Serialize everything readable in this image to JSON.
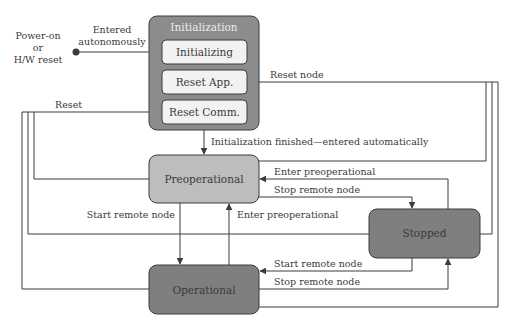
{
  "diagram": {
    "type": "state-machine",
    "colors": {
      "background": "#ffffff",
      "line": "#3c3c3c",
      "text": "#3a3a3a",
      "initialization_fill": "#8c8c8c",
      "substate_fill": "#f2f2f2",
      "preoperational_fill": "#bdbdbd",
      "stopped_fill": "#7f7f7f",
      "operational_fill": "#7f7f7f"
    },
    "start": {
      "label_lines": [
        "Power-on",
        "or",
        "H/W reset"
      ],
      "transition_label_lines": [
        "Entered",
        "autonomously"
      ]
    },
    "initialization": {
      "title": "Initialization",
      "substates": [
        {
          "id": "initializing",
          "label": "Initializing"
        },
        {
          "id": "reset-app",
          "label": "Reset App."
        },
        {
          "id": "reset-comm",
          "label": "Reset Comm."
        }
      ]
    },
    "states": {
      "preoperational": "Preoperational",
      "operational": "Operational",
      "stopped": "Stopped"
    },
    "transitions": {
      "reset_comm": "Reset",
      "reset_node": "Reset node",
      "init_finished": "Initialization finished—entered automatically",
      "preop_start": "Start remote node",
      "op_enter_preop": "Enter preoperational",
      "stopped_enter_preop": "Enter preoperational",
      "preop_stop": "Stop remote node",
      "stopped_start": "Start remote node",
      "op_stop": "Stop remote node"
    }
  }
}
